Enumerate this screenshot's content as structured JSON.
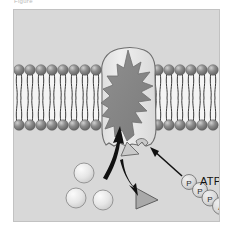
{
  "figure": {
    "caption": "Figure",
    "background_color": "#d8d8d8",
    "border_color": "#c2c2c2"
  },
  "membrane": {
    "name": "phospholipid-bilayer",
    "head_color": "#7d7d7d",
    "head_highlight": "#cfcfcf",
    "tail_color": "#3a3a3a",
    "top_y": 60,
    "bottom_y": 115,
    "head_count_left": 9,
    "head_count_right": 8,
    "head_radius": 5.2,
    "leaflet_label_outer": "outer leaflet",
    "leaflet_label_inner": "inner leaflet"
  },
  "protein": {
    "name": "carrier-protein",
    "shell_fill": "#e8e8e8",
    "shell_stroke": "#6d6d6d",
    "core_fill": "#8a8a8a",
    "core_stroke": "#6a6a6a",
    "label": "transport protein"
  },
  "solutes": {
    "name": "solute-molecules",
    "fill": "#e4e4e4",
    "stroke": "#8d8d8d",
    "count": 3,
    "positions": [
      {
        "cx": 70,
        "cy": 163,
        "r": 10
      },
      {
        "cx": 62,
        "cy": 188,
        "r": 10
      },
      {
        "cx": 89,
        "cy": 190,
        "r": 10
      }
    ]
  },
  "triangles": {
    "name": "transported-molecules",
    "fill": "#c9c9c9",
    "stroke": "#6f6f6f",
    "bound_label": "bound molecule",
    "released_label": "released molecule"
  },
  "arrows": {
    "uptake": "solute-uptake-arrow",
    "release": "molecule-release-arrow",
    "energy": "atp-energy-arrow",
    "color": "#111111"
  },
  "atp": {
    "name": "atp-molecule",
    "label": "ATP",
    "groups": [
      {
        "id": "p1",
        "text": "P",
        "cx": 175,
        "cy": 172,
        "r": 7.5
      },
      {
        "id": "p2",
        "text": "P",
        "cx": 186,
        "cy": 180,
        "r": 7.5
      },
      {
        "id": "p3",
        "text": "P",
        "cx": 196,
        "cy": 188,
        "r": 8.0
      },
      {
        "id": "a",
        "text": "A",
        "cx": 207,
        "cy": 196,
        "r": 8.5
      }
    ],
    "circle_fill": "#dcdcdc",
    "circle_stroke": "#787878",
    "text_color": "#2a2a2a"
  }
}
